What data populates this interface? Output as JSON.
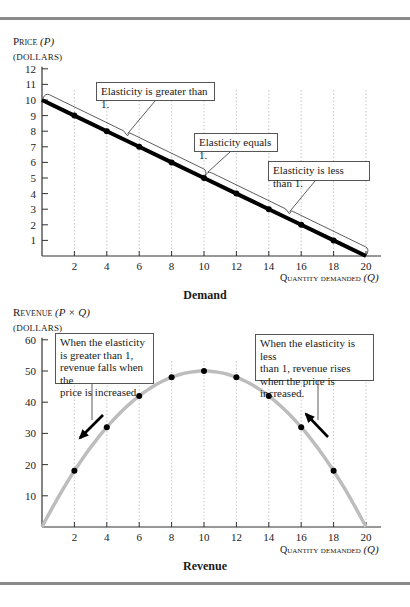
{
  "chart_data": [
    {
      "type": "line",
      "title": "Demand",
      "ylabel": "Price (P)",
      "ylabel_units": "(DOLLARS)",
      "xlabel": "Quantity demanded (Q)",
      "xlim": [
        0,
        20
      ],
      "ylim": [
        0,
        12
      ],
      "xticks": [
        2,
        4,
        6,
        8,
        10,
        12,
        14,
        16,
        18,
        20
      ],
      "yticks": [
        1,
        2,
        3,
        4,
        5,
        6,
        7,
        8,
        9,
        10,
        11,
        12
      ],
      "grid": "dotted vertical lines at x ticks",
      "series": [
        {
          "name": "Demand curve",
          "x": [
            0,
            2,
            4,
            6,
            8,
            10,
            12,
            14,
            16,
            18,
            20
          ],
          "y": [
            10,
            9,
            8,
            7,
            6,
            5,
            4,
            3,
            2,
            1,
            0
          ],
          "markers_at": [
            2,
            4,
            6,
            8,
            10,
            12,
            14,
            16,
            18
          ]
        }
      ],
      "annotations": [
        {
          "text": "Elasticity is greater than 1.",
          "brace_from_q": 0,
          "brace_to_q": 10
        },
        {
          "text": "Elasticity equals 1.",
          "at_q": 10
        },
        {
          "text": "Elasticity is less than 1.",
          "brace_from_q": 10,
          "brace_to_q": 20
        }
      ]
    },
    {
      "type": "line",
      "title": "Revenue",
      "ylabel": "Revenue (P × Q)",
      "ylabel_units": "(DOLLARS)",
      "xlabel": "Quantity demanded (Q)",
      "xlim": [
        0,
        20
      ],
      "ylim": [
        0,
        60
      ],
      "xticks": [
        2,
        4,
        6,
        8,
        10,
        12,
        14,
        16,
        18,
        20
      ],
      "yticks": [
        10,
        20,
        30,
        40,
        50,
        60
      ],
      "grid": "dotted vertical lines at x ticks",
      "series": [
        {
          "name": "Revenue curve",
          "x": [
            0,
            2,
            4,
            6,
            8,
            10,
            12,
            14,
            16,
            18,
            20
          ],
          "y": [
            0,
            18,
            32,
            42,
            48,
            50,
            48,
            42,
            32,
            18,
            0
          ],
          "markers_at": [
            2,
            4,
            6,
            8,
            10,
            12,
            14,
            16,
            18
          ]
        }
      ],
      "annotations": [
        {
          "text": "When the elasticity is greater than 1, revenue falls when the price is increased.",
          "arrow": "down-left",
          "near_q": 3
        },
        {
          "text": "When the elasticity is less than 1, revenue rises when the price is increased.",
          "arrow": "up-left",
          "near_q": 17
        }
      ]
    }
  ],
  "top": {
    "ylabel_main": "Price",
    "ylabel_var": "(P)",
    "units": "(DOLLARS)",
    "xlabel": "Quantity demanded",
    "xlabel_var": "(Q)",
    "caption": "Demand",
    "ann1": "Elasticity is greater than 1.",
    "ann2": "Elasticity equals 1.",
    "ann3": "Elasticity is less than 1."
  },
  "bottom": {
    "ylabel_main": "Revenue",
    "ylabel_var": "(P × Q)",
    "units": "(DOLLARS)",
    "xlabel": "Quantity demanded",
    "xlabel_var": "(Q)",
    "caption": "Revenue",
    "ann_left": "When the elasticity\nis greater than 1,\nrevenue falls when the\nprice is increased.",
    "ann_right": "When the elasticity is less\nthan 1, revenue rises\nwhen the price is increased."
  },
  "colors": {
    "demand_line": "#000000",
    "revenue_curve": "#bdbdbd",
    "rule": "#8a8a8a",
    "grid": "#bbbbbb"
  }
}
